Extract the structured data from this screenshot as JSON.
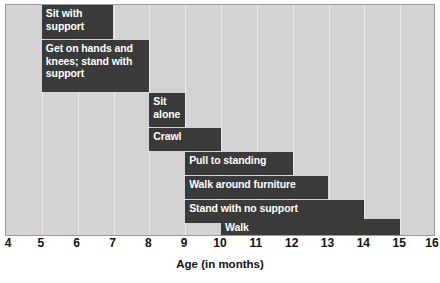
{
  "chart_data": {
    "type": "bar",
    "orientation": "horizontal",
    "subtype": "gantt-range",
    "title": "",
    "xlabel": "Age (in months)",
    "ylabel": "",
    "xlim": [
      4,
      16
    ],
    "xticks": [
      4,
      5,
      6,
      7,
      8,
      9,
      10,
      11,
      12,
      13,
      14,
      15,
      16
    ],
    "xtick_labels": [
      "4",
      "5",
      "6",
      "7",
      "8",
      "9",
      "10",
      "11",
      "12",
      "13",
      "14",
      "15",
      "16"
    ],
    "grid": true,
    "grid_axis": "x",
    "legend": false,
    "categories": [
      "Sit with support",
      "Get on hands and knees; stand with support",
      "Sit alone",
      "Crawl",
      "Pull to standing",
      "Walk around furniture",
      "Stand with no support",
      "Walk"
    ],
    "bars": [
      {
        "label": "Sit with\nsupport",
        "start": 5,
        "end": 7,
        "row": 0
      },
      {
        "label": "Get on hands and\nknees; stand with\nsupport",
        "start": 5,
        "end": 8,
        "row": 1
      },
      {
        "label": "Sit\nalone",
        "start": 8,
        "end": 9,
        "row": 2
      },
      {
        "label": "Crawl",
        "start": 8,
        "end": 10,
        "row": 3
      },
      {
        "label": "Pull to standing",
        "start": 9,
        "end": 12,
        "row": 4
      },
      {
        "label": "Walk around furniture",
        "start": 9,
        "end": 13,
        "row": 5
      },
      {
        "label": "Stand with no support",
        "start": 9,
        "end": 14,
        "row": 6
      },
      {
        "label": "Walk",
        "start": 10,
        "end": 15,
        "row": 7
      }
    ],
    "colors": {
      "bar": "#3a3a3a",
      "plot_background": "#d3d3d3",
      "gridline": "#e9e9e9",
      "bar_text": "#ffffff",
      "axis_text": "#111111",
      "page_background": "#ffffff"
    },
    "geometry": {
      "plot_left_px": 5,
      "plot_top_px": 4,
      "plot_width_px": 430,
      "plot_height_px": 232,
      "rows_px": [
        {
          "top": 0,
          "height": 34
        },
        {
          "height": 52,
          "top": 35
        },
        {
          "top": 88,
          "height": 34
        },
        {
          "top": 123,
          "height": 23
        },
        {
          "top": 147,
          "height": 23
        },
        {
          "top": 171,
          "height": 23
        },
        {
          "top": 195,
          "height": 23
        },
        {
          "top": 214,
          "height": 18
        }
      ]
    }
  }
}
